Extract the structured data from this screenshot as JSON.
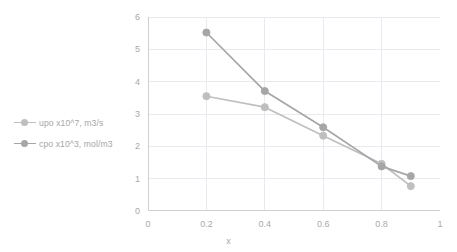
{
  "chart_data": {
    "type": "line",
    "title": "",
    "xlabel": "x",
    "ylabel": "",
    "x": [
      0.2,
      0.4,
      0.6,
      0.8,
      0.9
    ],
    "xlim": [
      0,
      1
    ],
    "ylim": [
      0,
      6
    ],
    "xticks": [
      "0",
      "0.2",
      "0.4",
      "0.6",
      "0.8",
      "1"
    ],
    "xtick_values": [
      0,
      0.2,
      0.4,
      0.6,
      0.8,
      1
    ],
    "yticks": [
      "0",
      "1",
      "2",
      "3",
      "4",
      "5",
      "6"
    ],
    "ytick_values": [
      0,
      1,
      2,
      3,
      4,
      5,
      6
    ],
    "grid": true,
    "grid_axis": "both",
    "legend_position": "left",
    "markers": "circle",
    "series": [
      {
        "name": "upo x10^7, m3/s",
        "color": "#bfbfbf",
        "values": [
          3.55,
          3.21,
          2.33,
          1.46,
          0.77
        ]
      },
      {
        "name": "cpo x10^3, mol/m3",
        "color": "#a6a6a6",
        "values": [
          5.52,
          3.71,
          2.59,
          1.38,
          1.08
        ]
      }
    ]
  },
  "axes": {
    "x_title": "x"
  },
  "colors": {
    "grid": "#e6ebf2",
    "axis": "#d0d0d0",
    "text": "#a9a9a9",
    "series_upo": "#bfbfbf",
    "series_cpo": "#a6a6a6",
    "background": "#ffffff"
  }
}
